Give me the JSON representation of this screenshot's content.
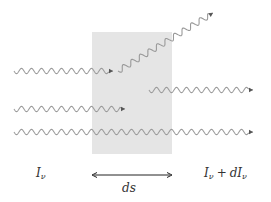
{
  "diagram": {
    "colors": {
      "background": "#ffffff",
      "slab": "#e5e5e5",
      "wave": "#999999",
      "wave_inside": "#7f7f7f",
      "arrow": "#555555",
      "text": "#333333"
    },
    "slab": {
      "x": 92,
      "y": 32,
      "width": 80,
      "height": 122
    },
    "waves": [
      {
        "id": "absorbed-ray",
        "x1": 14,
        "y1": 71,
        "x2": 113,
        "y2": 71,
        "wavelength": 10,
        "amplitude": 2.6,
        "arrow": true
      },
      {
        "id": "scattered-out-ray",
        "x1": 118,
        "y1": 71,
        "x2": 213,
        "y2": 13,
        "wavelength": 10,
        "amplitude": 2.8,
        "arrow": true
      },
      {
        "id": "emitted-ray",
        "x1": 149,
        "y1": 90,
        "x2": 253,
        "y2": 90,
        "wavelength": 10,
        "amplitude": 2.6,
        "arrow": true
      },
      {
        "id": "scattered-in-absorbed-ray",
        "x1": 14,
        "y1": 109,
        "x2": 125,
        "y2": 109,
        "wavelength": 10,
        "amplitude": 2.6,
        "arrow": true
      },
      {
        "id": "transmitted-ray",
        "x1": 14,
        "y1": 132,
        "x2": 253,
        "y2": 132,
        "wavelength": 10,
        "amplitude": 2.6,
        "arrow": true
      }
    ],
    "ds_arrow": {
      "x1": 92,
      "x2": 172,
      "y": 175
    },
    "labels": {
      "incident_intensity": {
        "main": "I",
        "sub": "ν"
      },
      "path_length": "ds",
      "outgoing_intensity": {
        "main": "I",
        "sub": "ν",
        "op": "+",
        "d_prefix": "dI",
        "sub2": "ν"
      }
    }
  }
}
